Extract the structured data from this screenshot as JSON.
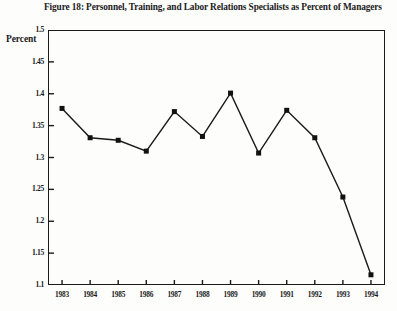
{
  "figure": {
    "title": "Figure 18: Personnel, Training, and Labor Relations Specialists as Percent of Managers",
    "y_axis_title": "Percent"
  },
  "colors": {
    "line": "#1a1a1a",
    "marker": "#111111",
    "axis": "#1a1a1a",
    "background": "#fdfdfc"
  },
  "chart_data": {
    "type": "line",
    "title": "Figure 18: Personnel, Training, and Labor Relations Specialists as Percent of Managers",
    "xlabel": "",
    "ylabel": "Percent",
    "categories": [
      "1983",
      "1984",
      "1985",
      "1986",
      "1987",
      "1988",
      "1989",
      "1990",
      "1991",
      "1992",
      "1993",
      "1994"
    ],
    "values": [
      1.377,
      1.331,
      1.327,
      1.31,
      1.372,
      1.333,
      1.401,
      1.307,
      1.374,
      1.331,
      1.238,
      1.116
    ],
    "series": [
      {
        "name": "Personnel, Training, and Labor Relations Specialists as Percent of Managers",
        "values": [
          1.377,
          1.331,
          1.327,
          1.31,
          1.372,
          1.333,
          1.401,
          1.307,
          1.374,
          1.331,
          1.238,
          1.116
        ]
      }
    ],
    "ylim": [
      1.1,
      1.5
    ],
    "yticks": [
      1.5,
      1.45,
      1.4,
      1.35,
      1.3,
      1.25,
      1.2,
      1.15,
      1.1
    ],
    "ytick_labels": [
      "1.5",
      "1.45",
      "1.4",
      "1.35",
      "1.3",
      "1.25",
      "1.2",
      "1.15",
      "1.1"
    ],
    "xtick_labels": [
      "1983",
      "1984",
      "1985",
      "1986",
      "1987",
      "1988",
      "1989",
      "1990",
      "1991",
      "1992",
      "1993",
      "1994"
    ],
    "grid": false,
    "legend": false,
    "marker": "square",
    "marker_size": 5
  }
}
